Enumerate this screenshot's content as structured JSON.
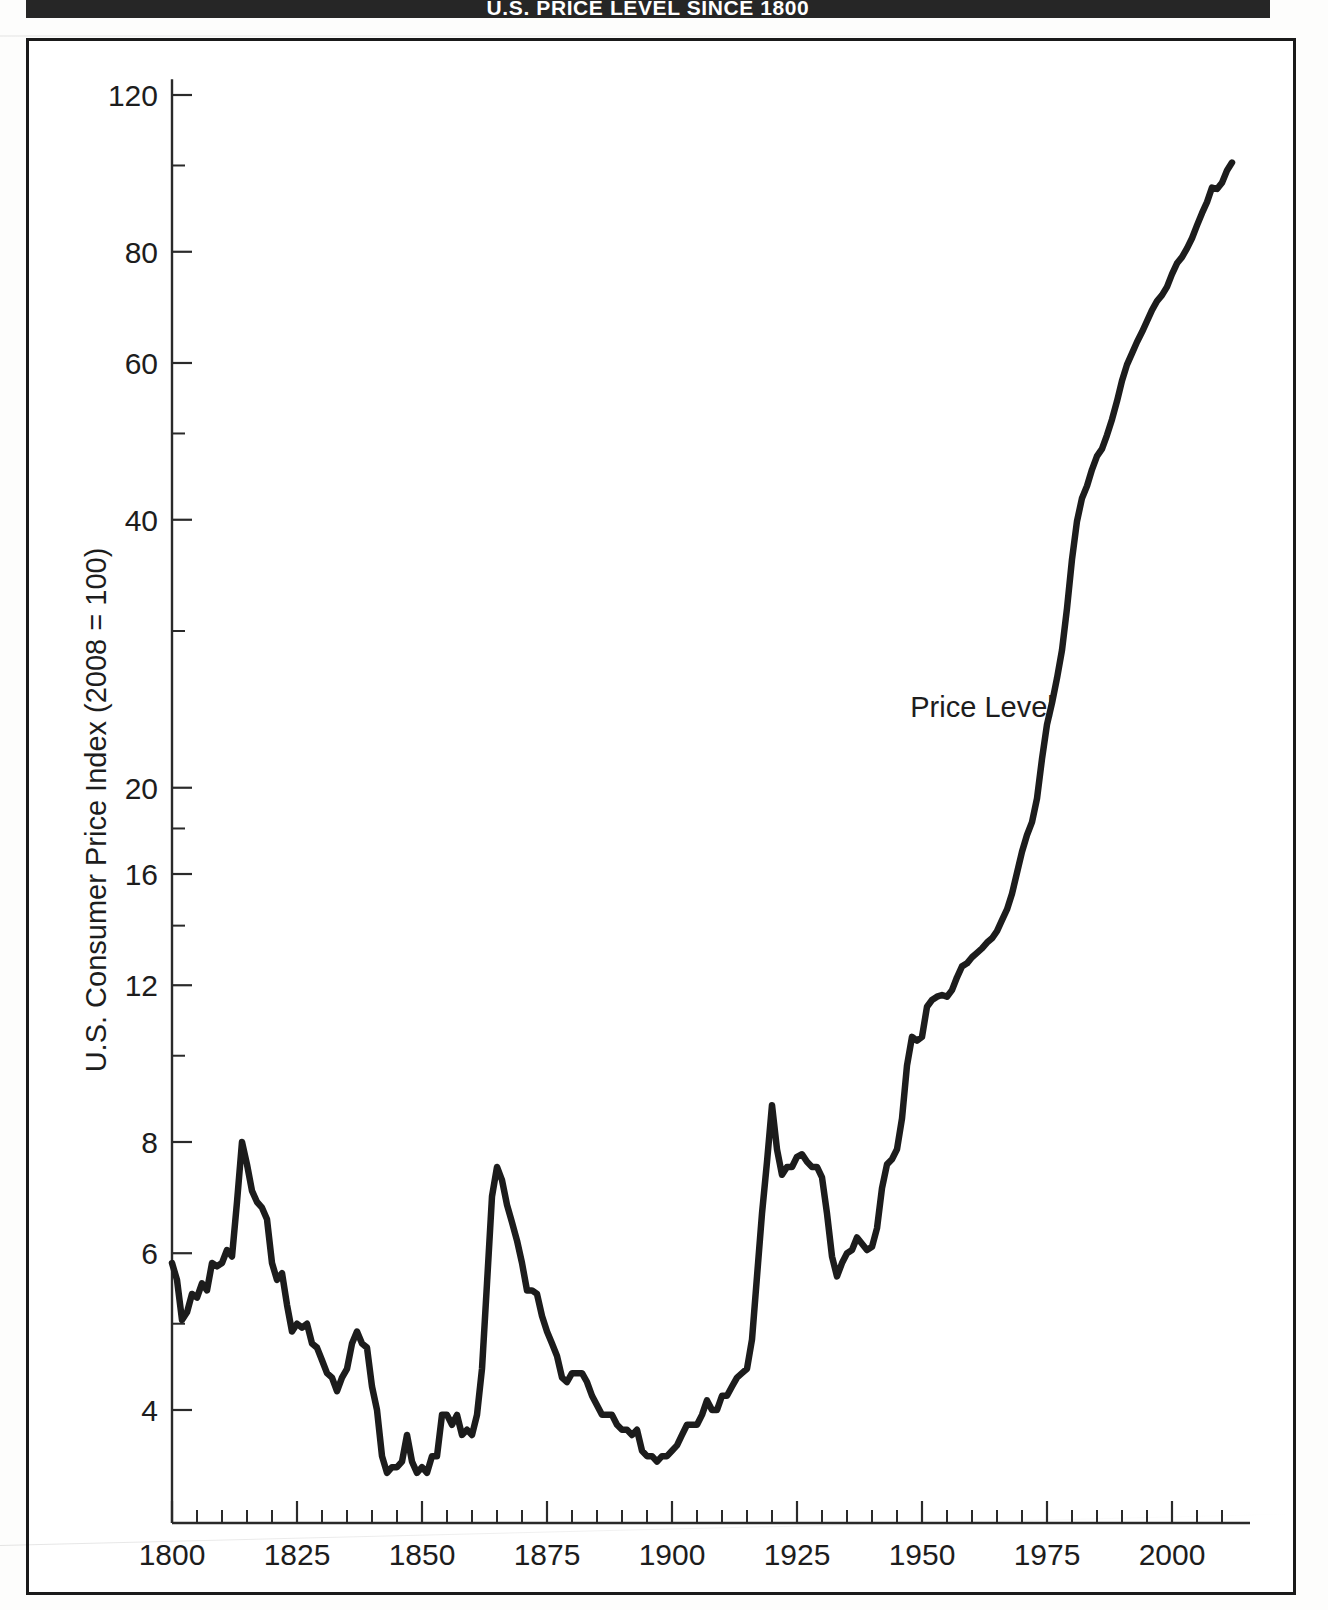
{
  "figure": {
    "title": "U.S. PRICE LEVEL SINCE 1800",
    "series_label": "Price Level"
  },
  "chart_data": {
    "type": "line",
    "title": "U.S. PRICE LEVEL SINCE 1800",
    "xlabel": "",
    "ylabel": "U.S. Consumer Price Index (2008 = 100)",
    "yscale": "log",
    "xscale": "linear",
    "xlim": [
      1800,
      2012
    ],
    "ylim": [
      2.95,
      125
    ],
    "grid": false,
    "legend": "none",
    "annotations": [
      {
        "text": "Price Level",
        "x": 1962,
        "y": 24.0
      }
    ],
    "x_ticks_major": [
      1800,
      1825,
      1850,
      1875,
      1900,
      1925,
      1950,
      1975,
      2000
    ],
    "x_tick_labels": [
      "1800",
      "1825",
      "1850",
      "1875",
      "1900",
      "1925",
      "1950",
      "1975",
      "2000"
    ],
    "x_ticks_minor_step": 5,
    "y_ticks_major": [
      4,
      6,
      8,
      12,
      16,
      20,
      40,
      60,
      80,
      120
    ],
    "y_tick_labels": [
      "4",
      "6",
      "8",
      "12",
      "16",
      "20",
      "40",
      "60",
      "80",
      "120"
    ],
    "y_ticks_minor": [
      5,
      10,
      14,
      18,
      30,
      50,
      100
    ],
    "series": [
      {
        "name": "Price Level",
        "x": [
          1800,
          1801,
          1802,
          1803,
          1804,
          1805,
          1806,
          1807,
          1808,
          1809,
          1810,
          1811,
          1812,
          1813,
          1814,
          1815,
          1816,
          1817,
          1818,
          1819,
          1820,
          1821,
          1822,
          1823,
          1824,
          1825,
          1826,
          1827,
          1828,
          1829,
          1830,
          1831,
          1832,
          1833,
          1834,
          1835,
          1836,
          1837,
          1838,
          1839,
          1840,
          1841,
          1842,
          1843,
          1844,
          1845,
          1846,
          1847,
          1848,
          1849,
          1850,
          1851,
          1852,
          1853,
          1854,
          1855,
          1856,
          1857,
          1858,
          1859,
          1860,
          1861,
          1862,
          1863,
          1864,
          1865,
          1866,
          1867,
          1868,
          1869,
          1870,
          1871,
          1872,
          1873,
          1874,
          1875,
          1876,
          1877,
          1878,
          1879,
          1880,
          1881,
          1882,
          1883,
          1884,
          1885,
          1886,
          1887,
          1888,
          1889,
          1890,
          1891,
          1892,
          1893,
          1894,
          1895,
          1896,
          1897,
          1898,
          1899,
          1900,
          1901,
          1902,
          1903,
          1904,
          1905,
          1906,
          1907,
          1908,
          1909,
          1910,
          1911,
          1912,
          1913,
          1914,
          1915,
          1916,
          1917,
          1918,
          1919,
          1920,
          1921,
          1922,
          1923,
          1924,
          1925,
          1926,
          1927,
          1928,
          1929,
          1930,
          1931,
          1932,
          1933,
          1934,
          1935,
          1936,
          1937,
          1938,
          1939,
          1940,
          1941,
          1942,
          1943,
          1944,
          1945,
          1946,
          1947,
          1948,
          1949,
          1950,
          1951,
          1952,
          1953,
          1954,
          1955,
          1956,
          1957,
          1958,
          1959,
          1960,
          1961,
          1962,
          1963,
          1964,
          1965,
          1966,
          1967,
          1968,
          1969,
          1970,
          1971,
          1972,
          1973,
          1974,
          1975,
          1976,
          1977,
          1978,
          1979,
          1980,
          1981,
          1982,
          1983,
          1984,
          1985,
          1986,
          1987,
          1988,
          1989,
          1990,
          1991,
          1992,
          1993,
          1994,
          1995,
          1996,
          1997,
          1998,
          1999,
          2000,
          2001,
          2002,
          2003,
          2004,
          2005,
          2006,
          2007,
          2008,
          2009,
          2010,
          2011,
          2012
        ],
        "y": [
          5.85,
          5.6,
          5.05,
          5.15,
          5.4,
          5.35,
          5.55,
          5.45,
          5.85,
          5.8,
          5.85,
          6.05,
          5.95,
          6.85,
          8.0,
          7.55,
          7.05,
          6.85,
          6.75,
          6.55,
          5.85,
          5.6,
          5.7,
          5.25,
          4.9,
          5.0,
          4.95,
          5.0,
          4.75,
          4.7,
          4.55,
          4.4,
          4.35,
          4.2,
          4.35,
          4.45,
          4.75,
          4.9,
          4.75,
          4.7,
          4.25,
          4.0,
          3.55,
          3.4,
          3.45,
          3.45,
          3.5,
          3.75,
          3.5,
          3.4,
          3.45,
          3.4,
          3.55,
          3.55,
          3.95,
          3.95,
          3.85,
          3.95,
          3.75,
          3.8,
          3.75,
          3.95,
          4.45,
          5.55,
          6.95,
          7.5,
          7.25,
          6.8,
          6.5,
          6.2,
          5.85,
          5.45,
          5.45,
          5.4,
          5.1,
          4.9,
          4.75,
          4.6,
          4.35,
          4.3,
          4.4,
          4.4,
          4.4,
          4.3,
          4.15,
          4.05,
          3.95,
          3.95,
          3.95,
          3.85,
          3.8,
          3.8,
          3.75,
          3.8,
          3.6,
          3.55,
          3.55,
          3.5,
          3.55,
          3.55,
          3.6,
          3.65,
          3.75,
          3.85,
          3.85,
          3.85,
          3.95,
          4.1,
          4.0,
          4.0,
          4.15,
          4.15,
          4.25,
          4.35,
          4.4,
          4.45,
          4.8,
          5.65,
          6.65,
          7.6,
          8.8,
          7.85,
          7.35,
          7.5,
          7.5,
          7.7,
          7.75,
          7.6,
          7.5,
          7.5,
          7.3,
          6.65,
          5.95,
          5.65,
          5.85,
          6.0,
          6.05,
          6.25,
          6.15,
          6.05,
          6.1,
          6.4,
          7.1,
          7.55,
          7.65,
          7.85,
          8.5,
          9.75,
          10.5,
          10.4,
          10.5,
          11.35,
          11.55,
          11.65,
          11.7,
          11.65,
          11.85,
          12.25,
          12.6,
          12.7,
          12.9,
          13.05,
          13.2,
          13.4,
          13.55,
          13.8,
          14.2,
          14.6,
          15.2,
          16.05,
          16.95,
          17.7,
          18.3,
          19.45,
          21.55,
          23.55,
          24.9,
          26.55,
          28.55,
          31.8,
          36.1,
          39.85,
          42.3,
          43.65,
          45.55,
          47.15,
          48.05,
          49.8,
          51.85,
          54.35,
          57.3,
          59.75,
          61.5,
          63.35,
          65.0,
          66.85,
          68.8,
          70.4,
          71.5,
          73.05,
          75.5,
          77.65,
          78.9,
          80.7,
          82.85,
          85.65,
          88.4,
          90.95,
          94.45,
          94.1,
          95.65,
          98.7,
          100.75
        ]
      }
    ]
  },
  "axes": {
    "y_title": "U.S. Consumer Price Index (2008 = 100)"
  }
}
